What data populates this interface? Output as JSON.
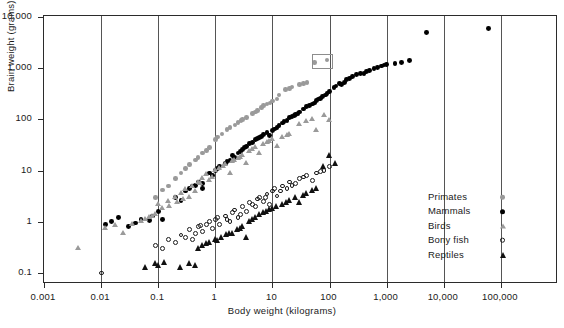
{
  "chart_data": {
    "type": "scatter",
    "title": "",
    "xlabel": "Body weight (kilograms)",
    "ylabel": "Brain weight (grams)",
    "xscale": "log",
    "yscale": "log",
    "xlim": [
      0.001,
      1000000
    ],
    "ylim": [
      0.05,
      10000
    ],
    "xticks": [
      "0.001",
      "0.01",
      "0.1",
      "1",
      "10",
      "100",
      "1,000",
      "10,000",
      "100,000"
    ],
    "xtick_values": [
      0.001,
      0.01,
      0.1,
      1,
      10,
      100,
      1000,
      10000,
      100000
    ],
    "yticks": [
      "10,000",
      "1,000",
      "100",
      "10",
      "1",
      "0.1"
    ],
    "ytick_values": [
      10000,
      1000,
      100,
      10,
      1,
      0.1
    ],
    "grid": "vertical-only",
    "legend_position": "inside-right",
    "annotation": {
      "type": "rectangle",
      "note": "small open box drawn around two adjacent primate points near 1,300-1,600 g",
      "x_range": [
        55,
        95
      ],
      "y_range": [
        1150,
        1750
      ]
    },
    "series": [
      {
        "name": "Primates",
        "marker": "filled-circle",
        "color": "#9a9a9a",
        "points": [
          [
            0.09,
            3.0
          ],
          [
            0.12,
            4.2
          ],
          [
            0.2,
            7.0
          ],
          [
            0.3,
            11.0
          ],
          [
            0.45,
            16.0
          ],
          [
            0.6,
            22.0
          ],
          [
            0.8,
            28.0
          ],
          [
            1.0,
            40.0
          ],
          [
            1.3,
            52.0
          ],
          [
            1.6,
            64.0
          ],
          [
            2.2,
            78.0
          ],
          [
            2.8,
            95.0
          ],
          [
            3.5,
            110.0
          ],
          [
            4.5,
            130.0
          ],
          [
            5.5,
            150.0
          ],
          [
            6.5,
            170.0
          ],
          [
            8.0,
            200.0
          ],
          [
            10.0,
            230.0
          ],
          [
            13.0,
            300.0
          ],
          [
            17.0,
            380.0
          ],
          [
            22.0,
            430.0
          ],
          [
            30.0,
            480.0
          ],
          [
            40.0,
            520.0
          ],
          [
            55.0,
            1300.0
          ],
          [
            90.0,
            1450.0
          ],
          [
            0.15,
            5.0
          ],
          [
            0.25,
            9.0
          ],
          [
            0.35,
            13.0
          ],
          [
            0.5,
            18.0
          ],
          [
            0.7,
            25.0
          ],
          [
            1.1,
            45.0
          ],
          [
            1.8,
            70.0
          ],
          [
            3.0,
            100.0
          ],
          [
            5.0,
            140.0
          ],
          [
            7.0,
            185.0
          ],
          [
            12.0,
            250.0
          ],
          [
            20.0,
            400.0
          ],
          [
            35.0,
            500.0
          ],
          [
            2.5,
            88.0
          ],
          [
            9.0,
            210.0
          ]
        ]
      },
      {
        "name": "Mammals",
        "marker": "filled-circle",
        "color": "#000000",
        "points": [
          [
            0.012,
            0.9
          ],
          [
            0.015,
            1.0
          ],
          [
            0.02,
            1.2
          ],
          [
            0.03,
            0.8
          ],
          [
            0.05,
            1.1
          ],
          [
            0.08,
            1.3
          ],
          [
            0.1,
            1.6
          ],
          [
            0.12,
            1.1
          ],
          [
            0.2,
            3.0
          ],
          [
            0.25,
            2.6
          ],
          [
            0.3,
            4.0
          ],
          [
            0.4,
            5.0
          ],
          [
            0.5,
            6.0
          ],
          [
            0.6,
            5.5
          ],
          [
            0.8,
            9.0
          ],
          [
            1.0,
            10.0
          ],
          [
            1.2,
            12.0
          ],
          [
            1.5,
            14.0
          ],
          [
            1.8,
            16.0
          ],
          [
            2.0,
            20.0
          ],
          [
            2.5,
            22.0
          ],
          [
            3.0,
            26.0
          ],
          [
            3.5,
            30.0
          ],
          [
            4.0,
            34.0
          ],
          [
            5.0,
            40.0
          ],
          [
            6.0,
            45.0
          ],
          [
            7.0,
            50.0
          ],
          [
            8.0,
            55.0
          ],
          [
            9.0,
            48.0
          ],
          [
            10.0,
            60.0
          ],
          [
            12.0,
            70.0
          ],
          [
            15.0,
            85.0
          ],
          [
            18.0,
            95.0
          ],
          [
            20.0,
            110.0
          ],
          [
            25.0,
            125.0
          ],
          [
            30.0,
            140.0
          ],
          [
            35.0,
            160.0
          ],
          [
            40.0,
            180.0
          ],
          [
            50.0,
            200.0
          ],
          [
            60.0,
            230.0
          ],
          [
            70.0,
            260.0
          ],
          [
            85.0,
            300.0
          ],
          [
            100.0,
            350.0
          ],
          [
            120.0,
            420.0
          ],
          [
            150.0,
            500.0
          ],
          [
            180.0,
            520.0
          ],
          [
            200.0,
            600.0
          ],
          [
            250.0,
            700.0
          ],
          [
            300.0,
            750.0
          ],
          [
            400.0,
            800.0
          ],
          [
            500.0,
            900.0
          ],
          [
            600.0,
            1000.0
          ],
          [
            800.0,
            1100.0
          ],
          [
            1000.0,
            1200.0
          ],
          [
            1400.0,
            1250.0
          ],
          [
            1800.0,
            1300.0
          ],
          [
            2500.0,
            1400.0
          ],
          [
            5000.0,
            5000.0
          ],
          [
            60000.0,
            6000.0
          ],
          [
            0.6,
            4.5
          ],
          [
            0.9,
            8.0
          ],
          [
            1.1,
            11.0
          ],
          [
            2.2,
            18.0
          ],
          [
            2.8,
            24.0
          ],
          [
            4.5,
            36.0
          ],
          [
            5.5,
            42.0
          ],
          [
            13.0,
            75.0
          ],
          [
            16.0,
            90.0
          ],
          [
            22.0,
            115.0
          ],
          [
            28.0,
            130.0
          ],
          [
            45.0,
            190.0
          ],
          [
            55.0,
            210.0
          ],
          [
            75.0,
            280.0
          ],
          [
            90.0,
            320.0
          ],
          [
            130.0,
            450.0
          ],
          [
            160.0,
            480.0
          ],
          [
            220.0,
            620.0
          ],
          [
            350.0,
            780.0
          ],
          [
            450.0,
            850.0
          ],
          [
            700.0,
            1050.0
          ],
          [
            900.0,
            1150.0
          ],
          [
            0.04,
            0.95
          ],
          [
            0.07,
            1.05
          ],
          [
            0.35,
            4.5
          ],
          [
            0.45,
            5.2
          ],
          [
            1.6,
            15.0
          ],
          [
            3.2,
            28.0
          ],
          [
            6.5,
            47.0
          ],
          [
            11.0,
            65.0
          ],
          [
            24.0,
            120.0
          ],
          [
            65.0,
            250.0
          ]
        ]
      },
      {
        "name": "Birds",
        "marker": "filled-triangle",
        "color": "#9a9a9a",
        "points": [
          [
            0.004,
            0.3
          ],
          [
            0.012,
            0.75
          ],
          [
            0.018,
            0.85
          ],
          [
            0.025,
            0.6
          ],
          [
            0.035,
            0.9
          ],
          [
            0.05,
            1.0
          ],
          [
            0.07,
            1.2
          ],
          [
            0.09,
            1.4
          ],
          [
            0.1,
            2.2
          ],
          [
            0.12,
            1.8
          ],
          [
            0.15,
            2.5
          ],
          [
            0.2,
            3.0
          ],
          [
            0.25,
            3.6
          ],
          [
            0.3,
            4.2
          ],
          [
            0.35,
            3.0
          ],
          [
            0.4,
            5.0
          ],
          [
            0.5,
            6.0
          ],
          [
            0.6,
            7.0
          ],
          [
            0.7,
            8.5
          ],
          [
            0.8,
            6.5
          ],
          [
            1.0,
            10.0
          ],
          [
            1.2,
            11.0
          ],
          [
            1.5,
            13.0
          ],
          [
            1.8,
            9.0
          ],
          [
            2.0,
            15.0
          ],
          [
            2.5,
            17.0
          ],
          [
            3.0,
            20.0
          ],
          [
            3.5,
            14.0
          ],
          [
            4.0,
            24.0
          ],
          [
            5.0,
            28.0
          ],
          [
            6.0,
            22.0
          ],
          [
            7.0,
            32.0
          ],
          [
            8.0,
            35.0
          ],
          [
            10.0,
            40.0
          ],
          [
            12.0,
            30.0
          ],
          [
            15.0,
            45.0
          ],
          [
            20.0,
            50.0
          ],
          [
            30.0,
            80.0
          ],
          [
            50.0,
            100.0
          ],
          [
            60.0,
            60.0
          ],
          [
            80.0,
            120.0
          ],
          [
            100.0,
            95.0
          ],
          [
            0.06,
            1.1
          ],
          [
            0.08,
            1.3
          ],
          [
            0.28,
            2.8
          ],
          [
            0.45,
            4.0
          ],
          [
            0.9,
            7.5
          ],
          [
            1.4,
            12.0
          ],
          [
            2.2,
            16.0
          ],
          [
            4.5,
            26.0
          ],
          [
            9.0,
            38.0
          ],
          [
            18.0,
            48.0
          ],
          [
            40.0,
            90.0
          ],
          [
            0.16,
            2.0
          ],
          [
            0.22,
            2.4
          ],
          [
            0.55,
            5.5
          ],
          [
            2.8,
            18.0
          ]
        ]
      },
      {
        "name": "Bony fish",
        "marker": "open-circle",
        "color": "#1a1a1a",
        "points": [
          [
            0.01,
            0.1
          ],
          [
            0.09,
            0.35
          ],
          [
            0.12,
            0.3
          ],
          [
            0.15,
            0.45
          ],
          [
            0.2,
            0.4
          ],
          [
            0.25,
            0.55
          ],
          [
            0.3,
            0.5
          ],
          [
            0.35,
            0.7
          ],
          [
            0.4,
            0.45
          ],
          [
            0.5,
            0.8
          ],
          [
            0.6,
            0.65
          ],
          [
            0.7,
            0.9
          ],
          [
            0.8,
            1.0
          ],
          [
            0.9,
            0.75
          ],
          [
            1.0,
            1.1
          ],
          [
            1.2,
            0.9
          ],
          [
            1.5,
            1.3
          ],
          [
            1.8,
            1.0
          ],
          [
            2.0,
            1.5
          ],
          [
            2.5,
            1.2
          ],
          [
            3.0,
            2.0
          ],
          [
            3.5,
            1.6
          ],
          [
            4.0,
            2.4
          ],
          [
            5.0,
            2.0
          ],
          [
            6.0,
            3.0
          ],
          [
            7.0,
            2.5
          ],
          [
            8.0,
            3.5
          ],
          [
            9.0,
            2.2
          ],
          [
            10.0,
            4.0
          ],
          [
            12.0,
            3.2
          ],
          [
            15.0,
            5.0
          ],
          [
            18.0,
            4.5
          ],
          [
            20.0,
            6.0
          ],
          [
            25.0,
            5.5
          ],
          [
            30.0,
            7.0
          ],
          [
            40.0,
            8.0
          ],
          [
            50.0,
            6.5
          ],
          [
            60.0,
            9.0
          ],
          [
            80.0,
            10.0
          ],
          [
            100.0,
            12.0
          ],
          [
            0.45,
            0.6
          ],
          [
            0.55,
            0.85
          ],
          [
            1.1,
            1.2
          ],
          [
            1.6,
            1.1
          ],
          [
            2.2,
            1.7
          ],
          [
            2.8,
            1.4
          ],
          [
            4.5,
            2.2
          ],
          [
            5.5,
            2.8
          ],
          [
            7.5,
            3.0
          ],
          [
            11.0,
            4.5
          ],
          [
            14.0,
            4.0
          ],
          [
            22.0,
            5.2
          ],
          [
            35.0,
            7.5
          ],
          [
            70.0,
            9.5
          ]
        ]
      },
      {
        "name": "Reptiles",
        "marker": "filled-triangle",
        "color": "#111111",
        "points": [
          [
            0.06,
            0.13
          ],
          [
            0.09,
            0.15
          ],
          [
            0.1,
            0.14
          ],
          [
            0.13,
            0.16
          ],
          [
            0.25,
            0.13
          ],
          [
            0.35,
            0.15
          ],
          [
            0.45,
            0.14
          ],
          [
            0.5,
            0.3
          ],
          [
            0.6,
            0.35
          ],
          [
            0.8,
            0.4
          ],
          [
            1.0,
            0.45
          ],
          [
            1.3,
            0.5
          ],
          [
            1.6,
            0.55
          ],
          [
            2.0,
            0.6
          ],
          [
            2.5,
            0.7
          ],
          [
            3.0,
            0.8
          ],
          [
            3.5,
            0.5
          ],
          [
            4.0,
            1.0
          ],
          [
            5.0,
            1.2
          ],
          [
            6.0,
            1.4
          ],
          [
            8.0,
            1.6
          ],
          [
            10.0,
            1.8
          ],
          [
            12.0,
            2.0
          ],
          [
            15.0,
            2.2
          ],
          [
            20.0,
            2.6
          ],
          [
            25.0,
            3.0
          ],
          [
            30.0,
            2.4
          ],
          [
            40.0,
            3.5
          ],
          [
            50.0,
            4.0
          ],
          [
            80.0,
            12.0
          ],
          [
            100.0,
            20.0
          ],
          [
            130.0,
            14.0
          ],
          [
            0.7,
            0.38
          ],
          [
            1.1,
            0.42
          ],
          [
            1.8,
            0.58
          ],
          [
            2.8,
            0.75
          ],
          [
            4.5,
            1.1
          ],
          [
            7.0,
            1.5
          ],
          [
            9.0,
            1.7
          ],
          [
            18.0,
            2.4
          ],
          [
            35.0,
            3.2
          ],
          [
            60.0,
            4.5
          ]
        ]
      }
    ]
  },
  "legend": {
    "items": [
      {
        "label": "Primates",
        "marker": "filled-circle-gray"
      },
      {
        "label": "Mammals",
        "marker": "filled-circle-black"
      },
      {
        "label": "Birds",
        "marker": "filled-triangle-gray"
      },
      {
        "label": "Bony fish",
        "marker": "open-circle"
      },
      {
        "label": "Reptiles",
        "marker": "filled-triangle-black"
      }
    ]
  },
  "colors": {
    "gray_marker": "#9a9a9a",
    "black_marker": "#000000",
    "frame": "#2b2b2b",
    "gridline": "#555555",
    "background": "#ffffff"
  }
}
